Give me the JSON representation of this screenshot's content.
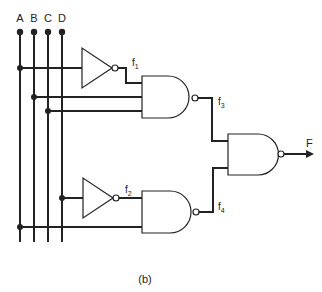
{
  "diagram": {
    "type": "logic-circuit",
    "inputs": [
      {
        "label": "A"
      },
      {
        "label": "B"
      },
      {
        "label": "C"
      },
      {
        "label": "D"
      }
    ],
    "signals": {
      "f1": {
        "base": "f",
        "sub": "1"
      },
      "f2": {
        "base": "f",
        "sub": "2"
      },
      "f3": {
        "base": "f",
        "sub": "3"
      },
      "f4": {
        "base": "f",
        "sub": "4"
      }
    },
    "output": {
      "label": "F"
    },
    "gates": [
      {
        "id": "inv1",
        "type": "NOT",
        "input": "A",
        "output": "f1"
      },
      {
        "id": "nand1",
        "type": "NAND",
        "inputs": [
          "f1",
          "B",
          "C"
        ],
        "output": "f3"
      },
      {
        "id": "inv2",
        "type": "NOT",
        "input": "D",
        "output": "f2"
      },
      {
        "id": "nand2",
        "type": "NAND",
        "inputs": [
          "f2",
          "A"
        ],
        "output": "f4"
      },
      {
        "id": "nand3",
        "type": "NAND",
        "inputs": [
          "f3",
          "f4"
        ],
        "output": "F"
      }
    ],
    "caption": "(b)",
    "colors": {
      "line": "#222222",
      "background": "#ffffff"
    }
  }
}
